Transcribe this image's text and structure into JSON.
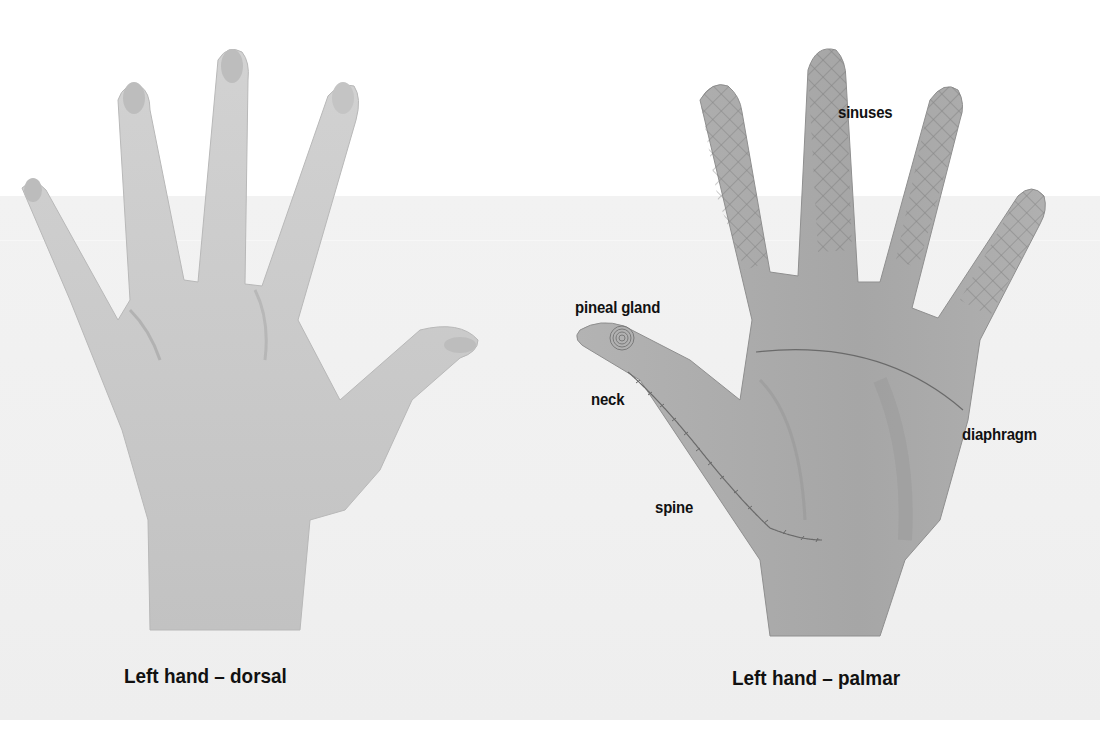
{
  "figure": {
    "left_hand": {
      "caption": "Left hand – dorsal"
    },
    "right_hand": {
      "caption": "Left hand – palmar",
      "labels": {
        "sinuses": "sinuses",
        "pineal_gland": "pineal gland",
        "neck": "neck",
        "spine": "spine",
        "diaphragm": "diaphragm"
      }
    }
  },
  "colors": {
    "background": "#ffffff",
    "band": "#f0f0f0",
    "skin_dorsal": "#c9c9c9",
    "skin_palmar": "#a9a9a9",
    "marking_lines": "#6e6e6e",
    "text": "#111111"
  }
}
